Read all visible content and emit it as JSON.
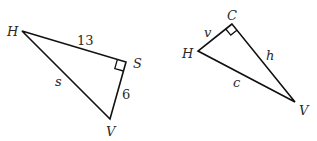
{
  "diagram": {
    "type": "right-triangles",
    "triangles": [
      {
        "id": "left",
        "vertices": {
          "H": {
            "label": "H",
            "x": 22,
            "y": 31
          },
          "S": {
            "label": "S",
            "x": 126,
            "y": 62
          },
          "V": {
            "label": "V",
            "x": 110,
            "y": 119
          }
        },
        "right_angle_at": "S",
        "sides": [
          {
            "between": "H-S",
            "label": "13"
          },
          {
            "between": "S-V",
            "label": "6"
          },
          {
            "between": "H-V",
            "label": "s"
          }
        ]
      },
      {
        "id": "right",
        "vertices": {
          "C": {
            "label": "C",
            "x": 232,
            "y": 24
          },
          "H": {
            "label": "H",
            "x": 198,
            "y": 51
          },
          "V": {
            "label": "V",
            "x": 295,
            "y": 102
          }
        },
        "right_angle_at": "C",
        "sides": [
          {
            "between": "H-C",
            "label": "v"
          },
          {
            "between": "C-V",
            "label": "h"
          },
          {
            "between": "H-V",
            "label": "c"
          }
        ]
      }
    ],
    "stroke_color": "#111111",
    "label_color": "#2a2a2a"
  }
}
